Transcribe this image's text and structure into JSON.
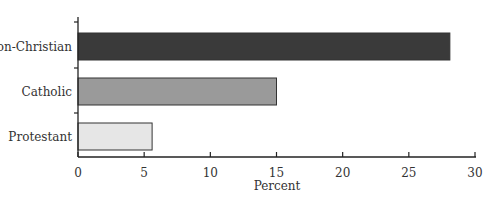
{
  "chart_data": {
    "type": "bar",
    "orientation": "horizontal",
    "title": "",
    "xlabel": "Percent",
    "ylabel": "",
    "categories": [
      "Non-Christian",
      "Catholic",
      "Protestant"
    ],
    "values": [
      28.1,
      15.0,
      5.6
    ],
    "colors": [
      "#3a3a3a",
      "#9a9a9a",
      "#e6e6e6"
    ],
    "xlim": [
      0,
      30
    ],
    "xticks": [
      0,
      5,
      10,
      15,
      20,
      25,
      30
    ],
    "grid": false,
    "legend": null
  }
}
